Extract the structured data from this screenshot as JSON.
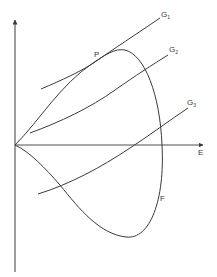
{
  "diagram": {
    "axes": {
      "x_label": "E",
      "y_label": ""
    },
    "curves": [
      {
        "id": "G1",
        "label": "G",
        "subscript": "1"
      },
      {
        "id": "G2",
        "label": "G",
        "subscript": "2"
      },
      {
        "id": "G3",
        "label": "G",
        "subscript": "3"
      },
      {
        "id": "F",
        "label": "F"
      }
    ],
    "points": [
      {
        "id": "P",
        "label": "P"
      }
    ],
    "colors": {
      "stroke": "#3a3a3a",
      "background": "#ffffff"
    }
  }
}
